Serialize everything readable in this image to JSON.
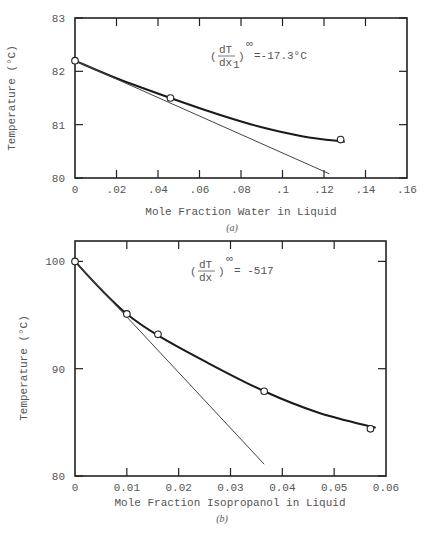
{
  "chart_data": [
    {
      "type": "scatter",
      "panel": "(a)",
      "title": "",
      "xlabel": "Mole Fraction Water in Liquid",
      "ylabel": "Temperature (°C)",
      "xlim": [
        0,
        0.16
      ],
      "ylim": [
        80,
        83
      ],
      "x_ticks": [
        "0",
        ".02",
        ".04",
        ".06",
        ".08",
        ".1",
        ".12",
        ".14",
        ".16"
      ],
      "y_ticks": [
        "80",
        "81",
        "82",
        "83"
      ],
      "grid": false,
      "annotation": "(dT/dx1)^∞ = -17.3°C",
      "annotation_parts": {
        "numer": "dT",
        "denom": "dx",
        "sub": "1",
        "sup": "∞",
        "value": "=-17.3°C"
      },
      "series": [
        {
          "name": "Data points",
          "style": "open-circle",
          "x": [
            0,
            0.046,
            0.128
          ],
          "y": [
            82.2,
            81.5,
            80.72
          ]
        },
        {
          "name": "Fitted curve",
          "style": "thick-line",
          "x": [
            0,
            0.02,
            0.046,
            0.07,
            0.09,
            0.11,
            0.13
          ],
          "y": [
            82.2,
            81.87,
            81.5,
            81.18,
            80.95,
            80.78,
            80.68
          ]
        },
        {
          "name": "Limiting slope tangent",
          "style": "thin-line",
          "x": [
            0,
            0.1225
          ],
          "y": [
            82.2,
            80.08
          ]
        }
      ]
    },
    {
      "type": "scatter",
      "panel": "(b)",
      "title": "",
      "xlabel": "Mole Fraction Isopropanol in Liquid",
      "ylabel": "Temperature (°C)",
      "xlim": [
        0,
        0.06
      ],
      "ylim": [
        80,
        102
      ],
      "x_ticks": [
        "0",
        "0.01",
        "0.02",
        "0.03",
        "0.04",
        "0.05",
        "0.06"
      ],
      "y_ticks": [
        "80",
        "90",
        "100"
      ],
      "grid": false,
      "annotation": "(dT/dx)^∞ = -517",
      "annotation_parts": {
        "numer": "dT",
        "denom": "dx",
        "sub": "",
        "sup": "∞",
        "value": "= -517"
      },
      "series": [
        {
          "name": "Data points",
          "style": "open-circle",
          "x": [
            0,
            0.01,
            0.016,
            0.0365,
            0.057
          ],
          "y": [
            100,
            95.1,
            93.2,
            87.9,
            84.4
          ]
        },
        {
          "name": "Fitted curve",
          "style": "thick-line",
          "x": [
            0,
            0.005,
            0.01,
            0.016,
            0.025,
            0.0365,
            0.047,
            0.058
          ],
          "y": [
            100,
            97.4,
            95.1,
            93.1,
            90.7,
            87.9,
            85.9,
            84.5
          ]
        },
        {
          "name": "Limiting slope tangent",
          "style": "thin-line",
          "x": [
            0,
            0.0365
          ],
          "y": [
            100,
            81.1
          ]
        }
      ]
    }
  ],
  "captions": {
    "a": "(a)",
    "b": "(b)"
  }
}
